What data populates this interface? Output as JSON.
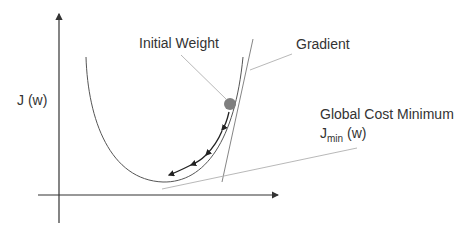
{
  "diagram": {
    "type": "gradient-descent",
    "labels": {
      "y_axis": "J (w)",
      "initial_weight": "Initial Weight",
      "gradient": "Gradient",
      "global_min_line1": "Global Cost Minimum",
      "global_min_J": "J",
      "global_min_sub": "min",
      "global_min_w": " (w)"
    },
    "colors": {
      "axis": "#333333",
      "curve": "#555555",
      "dot": "#7f7f7f",
      "leader": "#b0b0b0",
      "arrow": "#222222"
    }
  }
}
